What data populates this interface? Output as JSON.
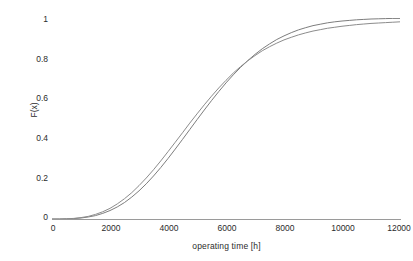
{
  "chart_data": {
    "type": "line",
    "title": "",
    "xlabel": "operating time [h]",
    "ylabel": "F(x)",
    "xlim": [
      0,
      12000
    ],
    "ylim": [
      0,
      1
    ],
    "grid": false,
    "legend": "none",
    "background_color": "#ffffff",
    "line_color": "#808080",
    "x_ticks": [
      {
        "value": 0,
        "label": "0"
      },
      {
        "value": 2000,
        "label": "2000"
      },
      {
        "value": 4000,
        "label": "4000"
      },
      {
        "value": 6000,
        "label": "6000"
      },
      {
        "value": 8000,
        "label": "8000"
      },
      {
        "value": 10000,
        "label": "10000"
      },
      {
        "value": 12000,
        "label": "12000"
      }
    ],
    "y_ticks": [
      {
        "value": 0,
        "label": "0"
      },
      {
        "value": 0.2,
        "label": "0.2"
      },
      {
        "value": 0.4,
        "label": "0.4"
      },
      {
        "value": 0.6,
        "label": "0.6"
      },
      {
        "value": 0.8,
        "label": "0.8"
      },
      {
        "value": 1,
        "label": "1"
      }
    ],
    "x": [
      0,
      250,
      500,
      750,
      1000,
      1250,
      1500,
      1750,
      2000,
      2250,
      2500,
      2750,
      3000,
      3250,
      3500,
      3750,
      4000,
      4250,
      4500,
      4750,
      5000,
      5250,
      5500,
      5750,
      6000,
      6250,
      6500,
      6750,
      7000,
      7250,
      7500,
      7750,
      8000,
      8250,
      8500,
      8750,
      9000,
      9250,
      9500,
      9750,
      10000,
      10250,
      10500,
      10750,
      11000,
      11250,
      11500,
      11750,
      12000
    ],
    "series": [
      {
        "name": "curve-1",
        "color": "#7d7d7d",
        "values": [
          0.0,
          0.0,
          0.001,
          0.002,
          0.005,
          0.01,
          0.017,
          0.028,
          0.042,
          0.06,
          0.082,
          0.109,
          0.14,
          0.175,
          0.214,
          0.256,
          0.301,
          0.348,
          0.396,
          0.445,
          0.494,
          0.542,
          0.589,
          0.634,
          0.677,
          0.717,
          0.754,
          0.788,
          0.819,
          0.847,
          0.871,
          0.893,
          0.911,
          0.927,
          0.941,
          0.952,
          0.962,
          0.969,
          0.976,
          0.981,
          0.985,
          0.988,
          0.991,
          0.993,
          0.995,
          0.996,
          0.997,
          0.998,
          0.998
        ]
      },
      {
        "name": "curve-2",
        "color": "#8c8c8c",
        "values": [
          0.0,
          0.0,
          0.001,
          0.003,
          0.007,
          0.013,
          0.023,
          0.036,
          0.053,
          0.075,
          0.101,
          0.131,
          0.166,
          0.204,
          0.245,
          0.289,
          0.335,
          0.382,
          0.429,
          0.477,
          0.523,
          0.568,
          0.611,
          0.652,
          0.69,
          0.726,
          0.758,
          0.787,
          0.813,
          0.837,
          0.857,
          0.875,
          0.891,
          0.904,
          0.916,
          0.926,
          0.935,
          0.942,
          0.949,
          0.954,
          0.959,
          0.963,
          0.967,
          0.97,
          0.973,
          0.975,
          0.977,
          0.979,
          0.981
        ]
      }
    ]
  }
}
